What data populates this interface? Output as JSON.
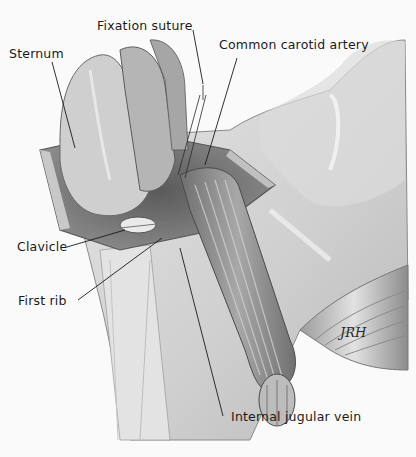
{
  "figure": {
    "type": "anatomical-illustration",
    "style": "grayscale pencil/airbrush surgical drawing",
    "signature": "JRH",
    "labels": [
      {
        "id": "fixation-suture",
        "text": "Fixation suture"
      },
      {
        "id": "common-carotid-artery",
        "text": "Common carotid artery"
      },
      {
        "id": "sternum",
        "text": "Sternum"
      },
      {
        "id": "clavicle",
        "text": "Clavicle"
      },
      {
        "id": "first-rib",
        "text": "First rib"
      },
      {
        "id": "internal-jugular-vein",
        "text": "Internal jugular vein"
      }
    ]
  },
  "colors": {
    "background": "#fafafa",
    "skin": "#d6d6d6",
    "skin_light": "#e8e8e8",
    "shadow": "#9a9a9a",
    "muscle": "#8a8a8a",
    "line": "#1a1a1a"
  }
}
